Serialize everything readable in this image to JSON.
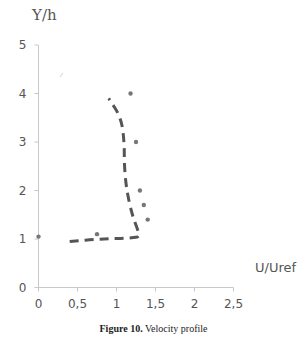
{
  "chart_data": {
    "type": "scatter",
    "title": "",
    "xlabel": "U/Uref",
    "ylabel": "Y/h",
    "xlim": [
      0,
      2.5
    ],
    "ylim": [
      0,
      5
    ],
    "x_ticks": [
      "0",
      "0,5",
      "1",
      "1,5",
      "2",
      "2,5"
    ],
    "x_tick_values": [
      0,
      0.5,
      1,
      1.5,
      2,
      2.5
    ],
    "y_ticks": [
      "0",
      "1",
      "2",
      "3",
      "4",
      "5"
    ],
    "y_tick_values": [
      0,
      1,
      2,
      3,
      4,
      5
    ],
    "grid": false,
    "legend": "none",
    "series": [
      {
        "name": "measured",
        "style": "markers",
        "color": "#777777",
        "points": [
          {
            "x": 0.0,
            "y": 1.05
          },
          {
            "x": 0.75,
            "y": 1.1
          },
          {
            "x": 1.18,
            "y": 4.0
          },
          {
            "x": 1.25,
            "y": 3.0
          },
          {
            "x": 1.3,
            "y": 2.0
          },
          {
            "x": 1.35,
            "y": 1.7
          },
          {
            "x": 1.4,
            "y": 1.4
          }
        ]
      },
      {
        "name": "computed",
        "style": "dashed-line",
        "color": "#555555",
        "points": [
          {
            "x": 0.4,
            "y": 0.95
          },
          {
            "x": 0.8,
            "y": 1.0
          },
          {
            "x": 1.2,
            "y": 1.02
          },
          {
            "x": 1.3,
            "y": 1.05
          },
          {
            "x": 1.27,
            "y": 1.2
          },
          {
            "x": 1.2,
            "y": 1.5
          },
          {
            "x": 1.13,
            "y": 2.0
          },
          {
            "x": 1.1,
            "y": 2.5
          },
          {
            "x": 1.1,
            "y": 3.0
          },
          {
            "x": 1.06,
            "y": 3.5
          },
          {
            "x": 0.9,
            "y": 3.9
          }
        ]
      }
    ]
  },
  "caption": {
    "label": "Figure 10.",
    "text": " Velocity profile"
  }
}
